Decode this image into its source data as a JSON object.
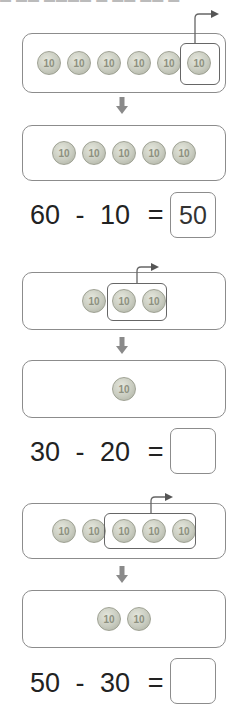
{
  "problems": [
    {
      "before_coins": [
        "10",
        "10",
        "10",
        "10",
        "10",
        "10"
      ],
      "taken_count": 1,
      "after_coins": [
        "10",
        "10",
        "10",
        "10",
        "10"
      ],
      "equation": {
        "a": "60",
        "op": "-",
        "b": "10",
        "eq": "=",
        "answer": "50"
      }
    },
    {
      "before_coins": [
        "10",
        "10",
        "10"
      ],
      "taken_count": 2,
      "after_coins": [
        "10"
      ],
      "equation": {
        "a": "30",
        "op": "-",
        "b": "20",
        "eq": "=",
        "answer": ""
      }
    },
    {
      "before_coins": [
        "10",
        "10",
        "10",
        "10",
        "10"
      ],
      "taken_count": 3,
      "after_coins": [
        "10",
        "10"
      ],
      "equation": {
        "a": "50",
        "op": "-",
        "b": "30",
        "eq": "=",
        "answer": ""
      }
    }
  ],
  "colors": {
    "border": "#8c8c8c",
    "coin": "#c9ccc0",
    "arrow": "#888888"
  }
}
